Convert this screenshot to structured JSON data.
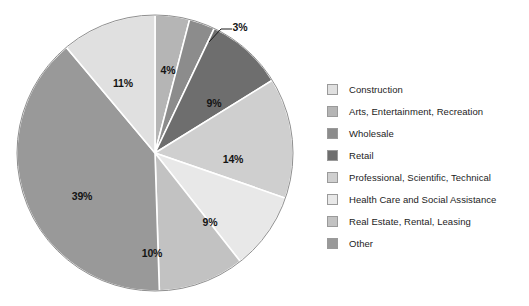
{
  "chart_data": {
    "type": "pie",
    "title": "",
    "subtitle": "",
    "xlabel": "",
    "ylabel": "",
    "legend_position": "right",
    "grid": false,
    "categories": [
      "Construction",
      "Arts, Entertainment, Recreation",
      "Wholesale",
      "Retail",
      "Professional, Scientific, Technical",
      "Health Care and Social Assistance",
      "Real Estate, Rental, Leasing",
      "Other"
    ],
    "values": [
      11,
      4,
      3,
      9,
      14,
      9,
      10,
      39
    ],
    "value_labels": [
      "11%",
      "4%",
      "3%",
      "9%",
      "14%",
      "9%",
      "10%",
      "39%"
    ],
    "colors": [
      "#e0e0e0",
      "#b5b5b5",
      "#8c8c8c",
      "#6e6e6e",
      "#cfcfcf",
      "#e8e8e8",
      "#c2c2c2",
      "#999999"
    ],
    "slice_separator_color": "#ffffff",
    "border_color": "#8f8f8f",
    "units": "percent",
    "total": 99
  },
  "legend": {
    "items": [
      {
        "label": "Construction",
        "color": "#e0e0e0",
        "value": "11%"
      },
      {
        "label": "Arts, Entertainment, Recreation",
        "color": "#b5b5b5",
        "value": "4%"
      },
      {
        "label": "Wholesale",
        "color": "#8c8c8c",
        "value": "3%"
      },
      {
        "label": "Retail",
        "color": "#6e6e6e",
        "value": "9%"
      },
      {
        "label": "Professional, Scientific, Technical",
        "color": "#cfcfcf",
        "value": "14%"
      },
      {
        "label": "Health Care and Social Assistance",
        "color": "#e8e8e8",
        "value": "9%"
      },
      {
        "label": "Real Estate, Rental, Leasing",
        "color": "#c2c2c2",
        "value": "10%"
      },
      {
        "label": "Other",
        "color": "#999999",
        "value": "39%"
      }
    ]
  },
  "pie_labels": [
    {
      "text": "4%",
      "x": 168,
      "y": 70,
      "callout": false
    },
    {
      "text": "3%",
      "x": 240,
      "y": 27,
      "callout": true
    },
    {
      "text": "9%",
      "x": 214,
      "y": 103,
      "callout": false
    },
    {
      "text": "14%",
      "x": 233,
      "y": 159,
      "callout": false
    },
    {
      "text": "9%",
      "x": 210,
      "y": 222,
      "callout": false
    },
    {
      "text": "10%",
      "x": 152,
      "y": 253,
      "callout": false
    },
    {
      "text": "39%",
      "x": 82,
      "y": 196,
      "callout": false
    },
    {
      "text": "11%",
      "x": 123,
      "y": 83,
      "callout": false
    }
  ]
}
